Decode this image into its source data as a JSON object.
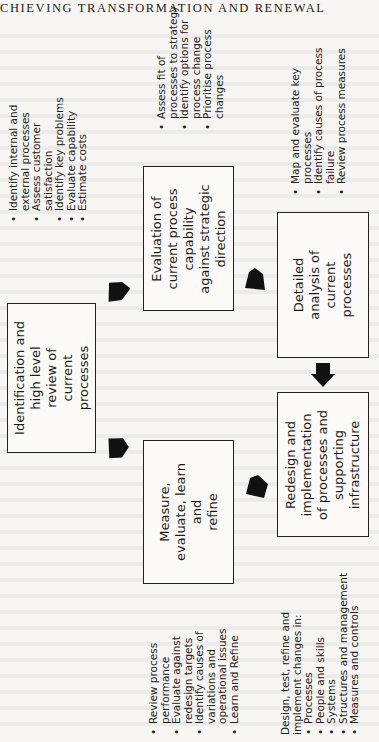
{
  "header": {
    "running_title": "CHIEVING TRANSFORMATION AND RENEWAL"
  },
  "diagram": {
    "boxes": [
      {
        "id": "identification",
        "lines": [
          "Identification and",
          "high level",
          "review of",
          "current",
          "processes"
        ]
      },
      {
        "id": "evaluation",
        "lines": [
          "Evaluation of",
          "current process",
          "capability",
          "against strategic",
          "direction"
        ]
      },
      {
        "id": "detailed-analysis",
        "lines": [
          "Detailed",
          "analysis of",
          "current",
          "processes"
        ]
      },
      {
        "id": "redesign",
        "lines": [
          "Redesign and",
          "implementation",
          "of processes and",
          "supporting",
          "infrastructure"
        ]
      },
      {
        "id": "measure",
        "lines": [
          "Measure,",
          "evaluate, learn",
          "and",
          "refine"
        ]
      }
    ],
    "notes": {
      "identification": [
        [
          "Identify internal and",
          "external processes"
        ],
        [
          "Assess customer",
          "satisfaction"
        ],
        [
          "Identify key problems"
        ],
        [
          "Evaluate capability"
        ],
        [
          "Estimate costs"
        ]
      ],
      "evaluation": [
        [
          "Assess fit of",
          "processes to strategy"
        ],
        [
          "Identify options for",
          "process change"
        ],
        [
          "Prioritise process",
          "changes"
        ]
      ],
      "detailed_analysis": [
        [
          "Map and evaluate key",
          "processes"
        ],
        [
          "Identify causes of process",
          "failure"
        ],
        [
          "Review process measures"
        ]
      ],
      "measure": [
        [
          "Review process",
          "performance"
        ],
        [
          "Evaluate against",
          "redesign targets"
        ],
        [
          "Identify causes of",
          "variations and",
          "operational issues"
        ],
        [
          "Learn and Refine"
        ]
      ],
      "redesign_intro": [
        "Design, test, refine and",
        "implement changes in:"
      ],
      "redesign": [
        [
          "Processes"
        ],
        [
          "People and skills"
        ],
        [
          "Systems"
        ],
        [
          "Structures and management"
        ],
        [
          "Measures and controls"
        ]
      ]
    },
    "arrows": [
      {
        "from": "identification",
        "to": "evaluation",
        "icon": "arrow-icon"
      },
      {
        "from": "evaluation",
        "to": "detailed-analysis",
        "icon": "arrow-icon"
      },
      {
        "from": "detailed-analysis",
        "to": "redesign",
        "icon": "arrow-icon"
      },
      {
        "from": "redesign",
        "to": "measure",
        "icon": "arrow-icon"
      },
      {
        "from": "measure",
        "to": "identification",
        "icon": "arrow-icon"
      }
    ]
  }
}
